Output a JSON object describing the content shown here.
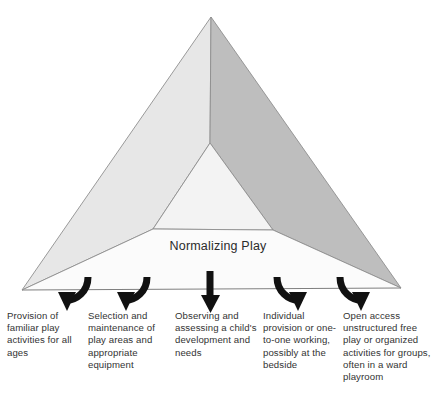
{
  "diagram": {
    "type": "pyramid-with-arrows",
    "title": "Normalizing Play",
    "center_label": "Normalizing Play",
    "colors": {
      "face_left": "#e6e6e6",
      "face_right": "#bdbdbd",
      "face_front_inner": "#f2f2f2",
      "face_front_base": "#ededed",
      "outline": "#8a8a8a",
      "arrow": "#111111",
      "text": "#333333",
      "background": "#ffffff"
    },
    "pyramid": {
      "apex": [
        211,
        17
      ],
      "base_left": [
        22,
        290
      ],
      "base_right": [
        401,
        288
      ],
      "inner_top": [
        210,
        143
      ],
      "inner_bottom_left": [
        153,
        229
      ],
      "inner_bottom_right": [
        273,
        230
      ]
    },
    "arrows": [
      {
        "name": "arrow-curve-left-outer",
        "direction": "curve-left-down",
        "x": 75,
        "y": 276
      },
      {
        "name": "arrow-curve-left-inner",
        "direction": "curve-left-down",
        "x": 134,
        "y": 276
      },
      {
        "name": "arrow-straight-center",
        "direction": "straight-down",
        "x": 210,
        "y": 270
      },
      {
        "name": "arrow-curve-right-inner",
        "direction": "curve-right-down",
        "x": 290,
        "y": 276
      },
      {
        "name": "arrow-curve-right-outer",
        "direction": "curve-right-down",
        "x": 352,
        "y": 276
      }
    ],
    "captions": [
      "Provision of familiar play activities for all ages",
      "Selection and maintenance of play areas and appropriate equipment",
      "Observing and assessing a child's development and needs",
      "Individual provision or one-to-one working, possibly at the bedside",
      "Open access unstructured free play or organized activities for groups, often in a ward playroom"
    ]
  }
}
